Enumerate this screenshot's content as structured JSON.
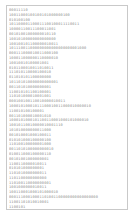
{
  "document": {
    "page_label": "binary-text-page",
    "background_color": "#ffffff",
    "border_color": "#c9c9c9",
    "text_color": "#8d8d8d",
    "lines": [
      "00011110",
      "10011000100100101000000100",
      "010100100",
      "101100001100011100100011110011",
      "10000110011100011001",
      "00101001000000010110",
      "10010100000000000000",
      "100100101100000010011",
      "101110011000000000000000000001000",
      "000111000010011000100",
      "100011000000110000010",
      "10010010100001001",
      "0101100010011010011",
      "111010110000100010",
      "011010101100000000",
      "101101010000000000001",
      "001101010000000001",
      "110010101100100001",
      "110101000010001001",
      "000100100110010000010011",
      "10001010001011100010011000010000010",
      "110010100100001",
      "001101000010001010",
      "1000101000101100110001000101000010",
      "10010110010000010001110",
      "101010000000011000",
      "001010001000100011",
      "010101000100000100",
      "110100100000001000",
      "0011010100000000010",
      "010011000100000110",
      "00101001000000001",
      "1100110000010011",
      "010101000000001",
      "1101010000000011",
      "1101100000000000",
      "110100110000000001",
      "1001000000010011",
      "100110001000101000010",
      "00011100010001101001100000000000000000",
      "11001101010010001",
      "1100101"
    ]
  }
}
